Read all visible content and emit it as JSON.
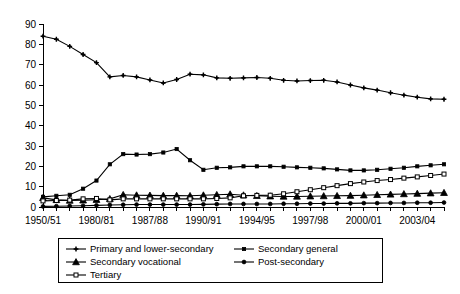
{
  "chart_data": {
    "type": "line",
    "title": "",
    "subtitle": "",
    "xlabel": "",
    "ylabel": "",
    "ylim": [
      0,
      90
    ],
    "ytick_step": 10,
    "yticks": [
      0,
      10,
      20,
      30,
      40,
      50,
      60,
      70,
      80,
      90
    ],
    "grid": false,
    "legend_position": "bottom",
    "x": [
      "1950/51",
      "",
      "",
      "",
      "1980/81",
      "",
      "",
      "",
      "1987/88",
      "",
      "",
      "",
      "1990/91",
      "",
      "",
      "",
      "1994/95",
      "",
      "",
      "",
      "1997/98",
      "",
      "",
      "",
      "2000/01",
      "",
      "",
      "",
      "2003/04",
      "",
      ""
    ],
    "xtick_labels": [
      "1950/51",
      "1980/81",
      "1987/88",
      "1990/91",
      "1994/95",
      "1997/98",
      "2000/01",
      "2003/04"
    ],
    "xtick_label_indices": [
      0,
      4,
      8,
      12,
      16,
      20,
      24,
      28
    ],
    "n_points": 31,
    "series": [
      {
        "name": "Primary and lower-secondary",
        "marker": "plus-diamond",
        "marker_filled": true,
        "values": [
          84,
          82.5,
          79,
          75,
          71,
          64,
          64.7,
          64,
          62.5,
          61,
          62.7,
          65.3,
          65,
          63.5,
          63.3,
          63.5,
          63.7,
          63.3,
          62.3,
          62,
          62.2,
          62.3,
          61.5,
          60,
          58.6,
          57.5,
          56.2,
          55,
          54,
          53.2,
          53
        ]
      },
      {
        "name": "Secondary general",
        "marker": "square",
        "marker_filled": true,
        "values": [
          5,
          5.5,
          6,
          9,
          13,
          21,
          26,
          25.8,
          26,
          26.8,
          28.5,
          23,
          18.3,
          19.3,
          19.5,
          20,
          20,
          20,
          19.8,
          19.5,
          19.3,
          19,
          18.5,
          18,
          18,
          18.3,
          18.8,
          19.3,
          20,
          20.5,
          21
        ]
      },
      {
        "name": "Secondary vocational",
        "marker": "triangle",
        "marker_filled": true,
        "values": [
          4.5,
          3.5,
          3.2,
          3.3,
          3.6,
          4,
          6,
          5.8,
          5.7,
          5.6,
          5.6,
          5.5,
          5.8,
          6,
          6.3,
          5.8,
          5.5,
          5.3,
          5.2,
          5.2,
          5.3,
          5.4,
          5.5,
          5.6,
          5.8,
          6,
          6.2,
          6.4,
          6.6,
          6.8,
          7
        ]
      },
      {
        "name": "Post-secondary",
        "marker": "circle",
        "marker_filled": true,
        "values": [
          0.3,
          0.4,
          0.5,
          0.6,
          0.8,
          1,
          1.1,
          1.2,
          1.2,
          1.2,
          1.2,
          1.2,
          1.3,
          1.4,
          1.5,
          1.5,
          1.5,
          1.5,
          1.6,
          1.6,
          1.7,
          1.7,
          1.8,
          1.8,
          1.9,
          1.9,
          2,
          2,
          2.1,
          2.1,
          2.2
        ]
      },
      {
        "name": "Tertiary",
        "marker": "square",
        "marker_filled": false,
        "values": [
          3,
          3.2,
          3.4,
          4,
          4.2,
          3.5,
          4,
          4,
          4,
          4,
          4,
          4,
          4,
          4.2,
          4.5,
          5.5,
          5.7,
          5.8,
          6.5,
          7.5,
          8.5,
          9.5,
          10.5,
          11.5,
          12.3,
          13,
          13.5,
          14.2,
          14.8,
          15.5,
          16.2
        ]
      }
    ]
  },
  "legend": {
    "entries": [
      {
        "label": "Primary and lower-secondary",
        "marker": "plus-diamond",
        "filled": true
      },
      {
        "label": "Secondary general",
        "marker": "square",
        "filled": true
      },
      {
        "label": "Secondary vocational",
        "marker": "triangle",
        "filled": true
      },
      {
        "label": "Post-secondary",
        "marker": "circle",
        "filled": true
      },
      {
        "label": "Tertiary",
        "marker": "square",
        "filled": false
      }
    ]
  },
  "colors": {
    "line": "#000000",
    "background": "#ffffff",
    "axis": "#000000"
  }
}
